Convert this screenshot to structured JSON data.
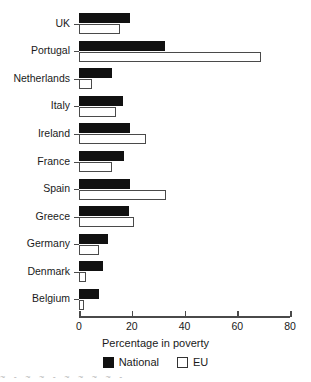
{
  "chart_data": {
    "type": "bar",
    "orientation": "horizontal",
    "title": "",
    "xlabel": "Percentage in poverty",
    "ylabel": "",
    "xlim": [
      0,
      80
    ],
    "xticks": [
      0,
      20,
      40,
      60,
      80
    ],
    "grid": false,
    "legend_position": "bottom",
    "categories": [
      "UK",
      "Portugal",
      "Netherlands",
      "Italy",
      "Ireland",
      "France",
      "Spain",
      "Greece",
      "Germany",
      "Denmark",
      "Belgium"
    ],
    "series": [
      {
        "name": "National",
        "color": "#111111",
        "values": [
          19.5,
          32.5,
          12.5,
          16.5,
          19.5,
          17.0,
          19.5,
          19.0,
          11.0,
          9.0,
          7.5
        ]
      },
      {
        "name": "EU",
        "color": "#ffffff",
        "values": [
          15.5,
          69.0,
          5.0,
          14.0,
          25.5,
          12.5,
          33.0,
          21.0,
          7.5,
          2.5,
          2.0
        ]
      }
    ]
  },
  "axis": {
    "x_title": "Percentage in poverty",
    "tick_labels": [
      "0",
      "20",
      "40",
      "60",
      "80"
    ]
  },
  "legend": {
    "items": [
      {
        "label": "National",
        "swatch": "filled-square-icon"
      },
      {
        "label": "EU",
        "swatch": "hollow-square-icon"
      }
    ]
  },
  "colors": {
    "national": "#111111",
    "eu_fill": "#ffffff",
    "eu_stroke": "#4a4a4a",
    "axis": "#4a4a4a",
    "text": "#1a1a1a",
    "background": "#ffffff"
  },
  "artifact": {
    "text": "~ - ~   ~ -      ~ ~         ~   ~ -"
  }
}
